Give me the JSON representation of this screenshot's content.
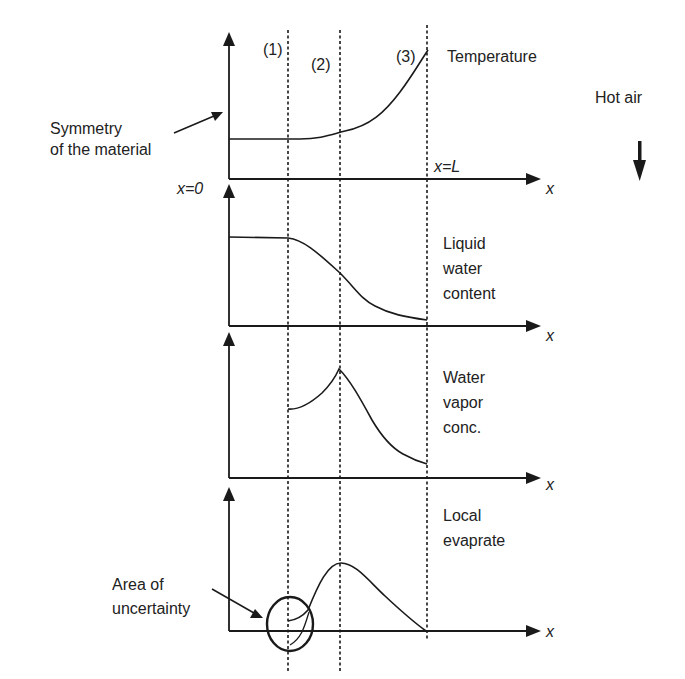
{
  "boundary_labels": [
    "(1)",
    "(2)",
    "(3)"
  ],
  "x_axis_symbol": "x",
  "x_start_label": "x=0",
  "x_end_label": "x=L",
  "annotations": {
    "symmetry": [
      "Symmetry",
      "of the material"
    ],
    "hot_air": "Hot air",
    "uncertainty": [
      "Area of",
      "uncertainty"
    ]
  },
  "panels": [
    {
      "id": "temperature",
      "label_lines": [
        "Temperature"
      ]
    },
    {
      "id": "liquid-water",
      "label_lines": [
        "Liquid",
        "water",
        "content"
      ]
    },
    {
      "id": "water-vapor",
      "label_lines": [
        "Water",
        "vapor",
        "conc."
      ]
    },
    {
      "id": "evaporation",
      "label_lines": [
        "Local",
        "evaprate"
      ]
    }
  ],
  "colors": {
    "ink": "#1a1a1a",
    "background": "#ffffff"
  }
}
